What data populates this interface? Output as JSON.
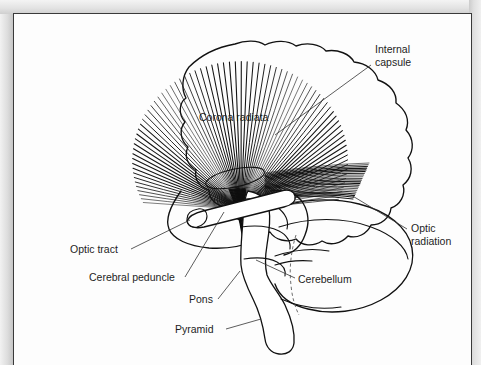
{
  "figure": {
    "page_background": "#fdfdfd",
    "ink_color": "#111111",
    "text_color": "#1d1d1d"
  },
  "labels": [
    {
      "id": "internal-capsule",
      "lines": [
        "Internal",
        "capsule"
      ],
      "x": 362,
      "y": 40,
      "anchor": "start",
      "leader": "M 358,52 L 262,122"
    },
    {
      "id": "corona-radiata",
      "lines": [
        "Corona radiata"
      ],
      "x": 186,
      "y": 108,
      "anchor": "start",
      "leader": ""
    },
    {
      "id": "optic-radiation",
      "lines": [
        "Optic",
        "radiation"
      ],
      "x": 398,
      "y": 219,
      "anchor": "start",
      "leader": "M 394,216 L 338,182"
    },
    {
      "id": "optic-tract",
      "lines": [
        "Optic tract"
      ],
      "x": 57,
      "y": 240,
      "anchor": "start",
      "leader": "M 118,236 L 177,207"
    },
    {
      "id": "cerebral-peduncle",
      "lines": [
        "Cerebral peduncle"
      ],
      "x": 76,
      "y": 268,
      "anchor": "start",
      "leader": "M 172,264 L 211,199"
    },
    {
      "id": "pons",
      "lines": [
        "Pons"
      ],
      "x": 176,
      "y": 290,
      "anchor": "start",
      "leader": "M 205,286 L 227,258"
    },
    {
      "id": "pyramid",
      "lines": [
        "Pyramid"
      ],
      "x": 162,
      "y": 320,
      "anchor": "start",
      "leader": "M 213,316 L 248,306"
    }
  ],
  "cerebellum_label": {
    "id": "cerebellum",
    "text": "Cerebellum",
    "x": 285,
    "y": 270,
    "leader": "M 282,265 L 243,247"
  },
  "structures": [
    {
      "id": "cerebrum-outline",
      "name": "cerebral-hemisphere"
    },
    {
      "id": "corona-radiata-fan",
      "name": "corona-radiata-fibers",
      "fiber_count": 78
    },
    {
      "id": "internal-capsule-ellipse",
      "name": "internal-capsule",
      "cx": 222,
      "cy": 165,
      "rx": 30,
      "ry": 9,
      "rotate": -12
    },
    {
      "id": "optic-tract-tube",
      "name": "optic-tract"
    },
    {
      "id": "cerebellum-body",
      "name": "cerebellum"
    },
    {
      "id": "brainstem",
      "name": "brainstem-pons-medulla"
    },
    {
      "id": "pyramidal-bundle",
      "name": "corticospinal-tract"
    }
  ]
}
